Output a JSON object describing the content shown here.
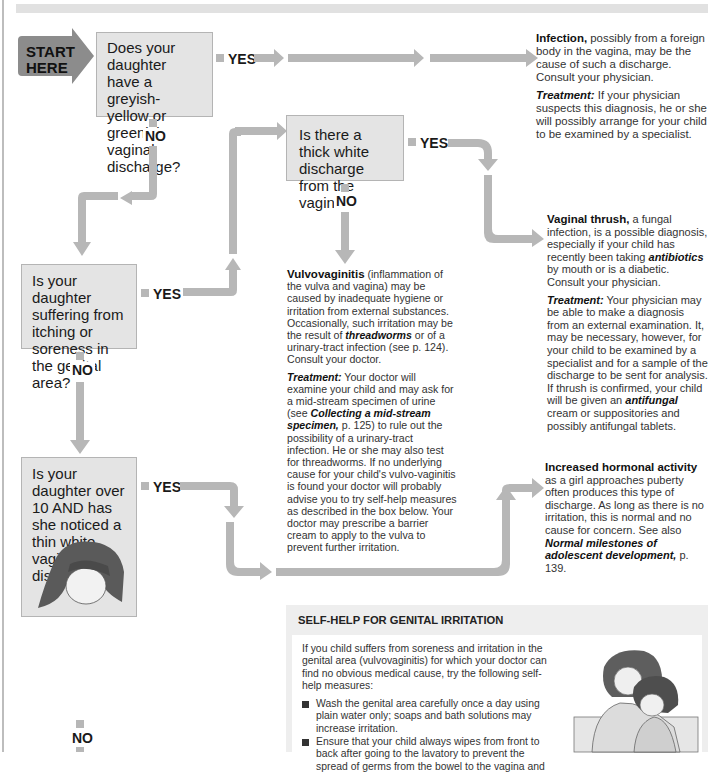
{
  "header": {
    "bar_color": "#e1e1e1"
  },
  "colors": {
    "arrow": "#b7b7b7",
    "question_box": "#e4e4e4",
    "start_arrow": "#8c8c8c",
    "text": "#333333"
  },
  "start": {
    "line1": "START",
    "line2": "HERE"
  },
  "questions": [
    {
      "id": "q1",
      "text": "Does your daughter have a greyish-yellow or greenish vaginal discharge?",
      "yes": "YES",
      "no": "NO"
    },
    {
      "id": "q2",
      "text": "Is there a thick white discharge from the vagina?",
      "yes": "YES",
      "no": "NO"
    },
    {
      "id": "q3",
      "text": "Is your daughter suffering from itching or soreness in the genital area?",
      "yes": "YES",
      "no": "NO"
    },
    {
      "id": "q4",
      "text": "Is your daughter over 10 AND has she noticed a thin white vaginal discharge?",
      "yes": "YES",
      "no": "NO"
    }
  ],
  "outcomes": {
    "infection": {
      "title": "Infection,",
      "text": " possibly from a foreign body in the vagina, may be the cause of such a discharge. Consult your physician.",
      "treatment_label": "Treatment:",
      "treatment": " If your physician suspects this diagnosis, he or she will possibly arrange for your child to be examined by a specialist."
    },
    "thrush": {
      "title": "Vaginal thrush,",
      "text1": " a fungal infection, is a possible diagnosis, especially if your child has recently been taking ",
      "em1": "antibiotics",
      "text2": " by mouth or is a diabetic. Consult your physician.",
      "treatment_label": "Treatment:",
      "treatment1": " Your physician may be able to make a diagnosis from an external examination. It, may be necessary, however, for your child to be examined by a specialist and for a sample of the discharge to be sent for analysis. If thrush is confirmed, your child will be given an ",
      "em2": "antifungal",
      "treatment2": " cream or suppositories and possibly antifungal tablets."
    },
    "vulvovaginitis": {
      "title": "Vulvovaginitis",
      "text1": " (inflammation of the vulva and vagina) may be caused by inadequate hygiene or irritation from external substances. Occasionally, such irritation may be the result of ",
      "em1": "threadworms",
      "text2": " or of a urinary-tract infection (see p. 124). Consult your doctor.",
      "treatment_label": "Treatment:",
      "treatment1": " Your doctor will examine your child and may ask for a mid-stream specimen of urine (see ",
      "em2": "Collecting a mid-stream specimen,",
      "treatment2": " p. 125) to rule out the possibility of a urinary-tract infection. He or she may also test for threadworms. If no underlying cause for your child's vulvo-vaginitis is found your doctor will probably advise you to try self-help measures as described in the box below. Your doctor may prescribe a barrier cream to apply to the vulva to prevent further irritation."
    },
    "hormonal": {
      "title": "Increased hormonal activity",
      "text1": " as a girl approaches puberty often produces this type of discharge. As long as there is no irritation, this is normal and no cause for concern. See also ",
      "em1": "Normal milestones of adolescent development,",
      "text2": " p. 139."
    }
  },
  "selfhelp": {
    "title": "SELF-HELP FOR GENITAL IRRITATION",
    "intro": "If you child suffers from soreness and irritation in the genital area (vulvovaginitis) for which your doctor can find no obvious medical cause, try the following self-help measures:",
    "items": [
      "Wash the genital area carefully once a day using plain water only; soaps and bath solutions may increase irritation.",
      "Ensure that your child always wipes from front to back after going to the lavatory to prevent the spread of germs from the bowel to the vagina and"
    ]
  },
  "illustrations": {
    "girl": "girl-illustration",
    "mother_child": "mother-and-child-illustration"
  }
}
